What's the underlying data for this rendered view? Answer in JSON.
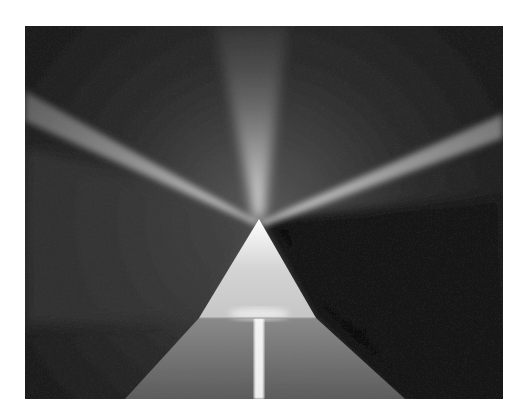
{
  "image": {
    "description": "Abstract artwork: a glowing white triangular prism on a dark textured surface emitting light rays",
    "colors": {
      "background": "#ffffff",
      "surface": "#1c1c1c",
      "light": "#f4f4f4",
      "prism": "#d8d8d8"
    },
    "prism": {
      "apex": [
        234,
        193
      ],
      "base_left": [
        174,
        292
      ],
      "base_right": [
        291,
        292
      ]
    },
    "rays": [
      {
        "name": "upper-left",
        "to": [
          0,
          78
        ]
      },
      {
        "name": "up",
        "to": [
          225,
          0
        ]
      },
      {
        "name": "upper-right",
        "to": [
          478,
          98
        ]
      },
      {
        "name": "down",
        "to": [
          234,
          373
        ]
      }
    ]
  }
}
